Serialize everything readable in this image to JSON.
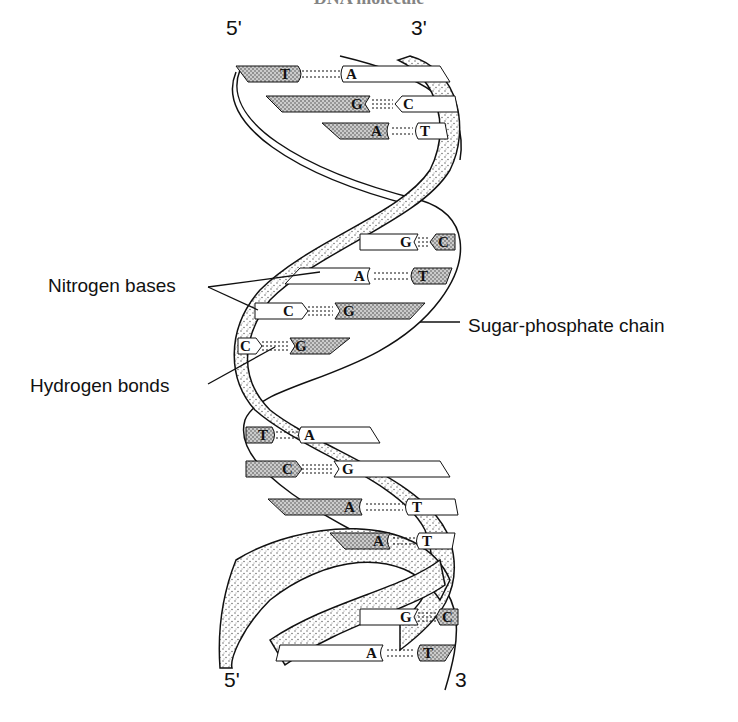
{
  "title": "DNA molecule",
  "ends": {
    "top_left": "5'",
    "top_right": "3'",
    "bottom_left": "5'",
    "bottom_right": "3"
  },
  "labels": {
    "nitrogen_bases": "Nitrogen bases",
    "hydrogen_bonds": "Hydrogen bonds",
    "sugar_phosphate": "Sugar-phosphate chain"
  },
  "base_pairs": [
    {
      "left": "T",
      "right": "A",
      "y": 74,
      "bonds": 2
    },
    {
      "left": "G",
      "right": "C",
      "y": 104,
      "bonds": 3
    },
    {
      "left": "A",
      "right": "T",
      "y": 131,
      "bonds": 2
    },
    {
      "left": "G",
      "right": "C",
      "y": 242,
      "bonds": 3
    },
    {
      "left": "A",
      "right": "T",
      "y": 276,
      "bonds": 2
    },
    {
      "left": "C",
      "right": "G",
      "y": 311,
      "bonds": 3
    },
    {
      "left": "C",
      "right": "G",
      "y": 346,
      "bonds": 3
    },
    {
      "left": "T",
      "right": "A",
      "y": 435,
      "bonds": 2
    },
    {
      "left": "C",
      "right": "G",
      "y": 469,
      "bonds": 3
    },
    {
      "left": "A",
      "right": "T",
      "y": 507,
      "bonds": 2
    },
    {
      "left": "A",
      "right": "T",
      "y": 541,
      "bonds": 2
    },
    {
      "left": "G",
      "right": "C",
      "y": 617,
      "bonds": 3
    },
    {
      "left": "A",
      "right": "T",
      "y": 653,
      "bonds": 2
    }
  ],
  "colors": {
    "ink": "#111111",
    "stipple": "#555555",
    "background": "#ffffff"
  }
}
